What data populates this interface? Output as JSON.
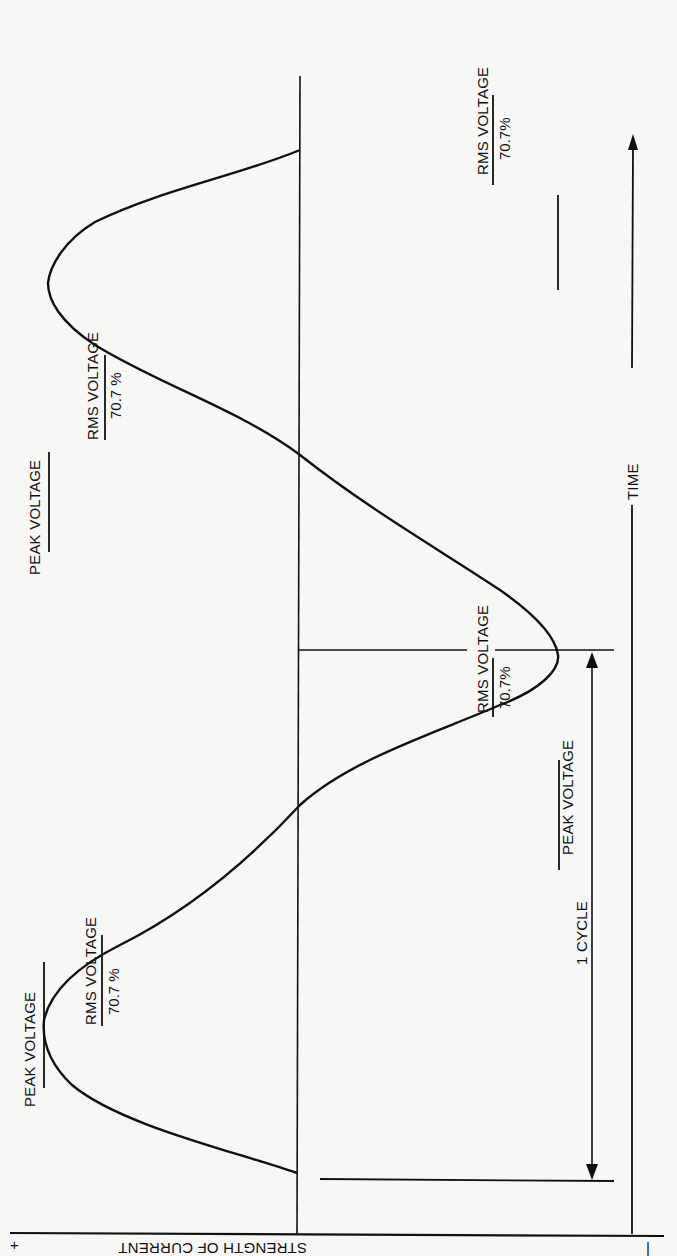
{
  "diagram": {
    "axis_labels": {
      "current_axis": "STRENGTH OF CURRENT",
      "plus_sign": "+",
      "minus_sign": "|",
      "time_axis": "TIME"
    },
    "annotations": {
      "peak_voltage_1": "PEAK VOLTAGE",
      "rms_voltage_1": "RMS VOLTAGE",
      "rms_percent_1": "70.7 %",
      "peak_voltage_2": "PEAK VOLTAGE",
      "rms_voltage_2": "RMS VOLTAGE",
      "rms_percent_2": "70.7%",
      "peak_voltage_3": "PEAK VOLTAGE",
      "rms_voltage_3": "RMS VOLTAGE",
      "rms_percent_3": "70.7 %",
      "rms_voltage_4": "RMS VOLTAGE",
      "rms_percent_4": "70.7%",
      "cycle_label": "1 CYCLE"
    },
    "colors": {
      "ink": "#111111",
      "paper": "#f7f7f5"
    }
  }
}
